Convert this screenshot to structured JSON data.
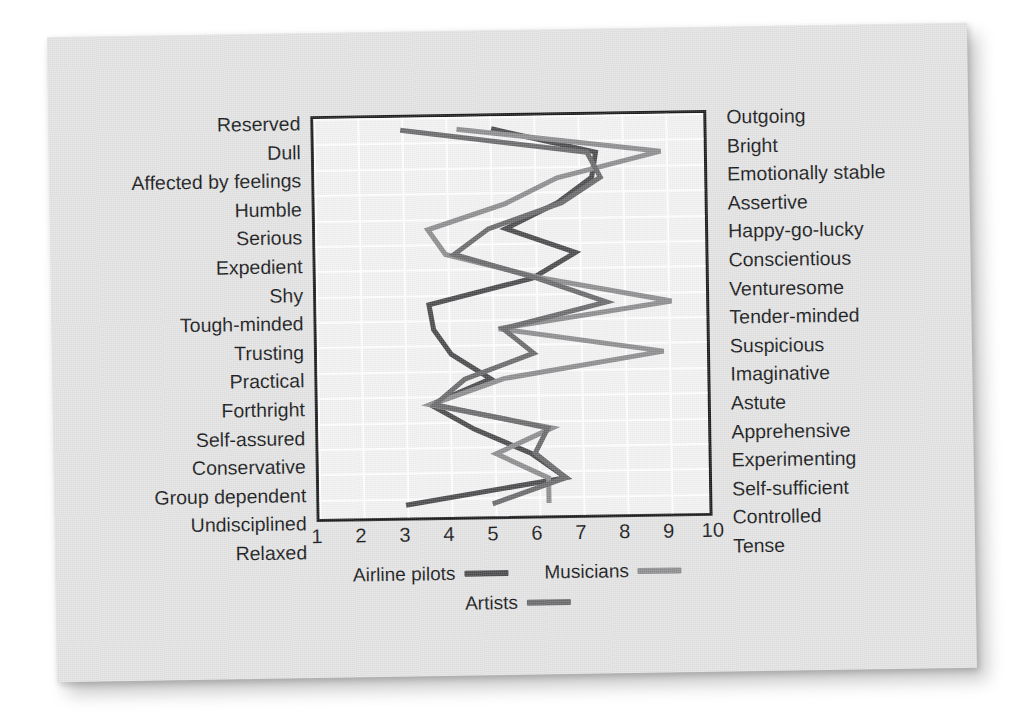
{
  "chart_data": {
    "type": "line",
    "title": "",
    "subtitle": "",
    "orientation": "horizontal-profile",
    "xlabel": "",
    "ylabel": "",
    "xlim": [
      1,
      10
    ],
    "xticks": [
      "1",
      "2",
      "3",
      "4",
      "5",
      "6",
      "7",
      "8",
      "9",
      "10"
    ],
    "grid": true,
    "legend_position": "bottom",
    "categories_left": [
      "Reserved",
      "Dull",
      "Affected by feelings",
      "Humble",
      "Serious",
      "Expedient",
      "Shy",
      "Tough-minded",
      "Trusting",
      "Practical",
      "Forthright",
      "Self-assured",
      "Conservative",
      "Group dependent",
      "Undisciplined",
      "Relaxed"
    ],
    "categories_right": [
      "Outgoing",
      "Bright",
      "Emotionally stable",
      "Assertive",
      "Happy-go-lucky",
      "Conscientious",
      "Venturesome",
      "Tender-minded",
      "Suspicious",
      "Imaginative",
      "Astute",
      "Apprehensive",
      "Experimenting",
      "Self-sufficient",
      "Controlled",
      "Tense"
    ],
    "series": [
      {
        "name": "Airline pilots",
        "color": "#4a4a4c",
        "values": [
          5.1,
          7.5,
          7.4,
          6.6,
          5.4,
          7.0,
          6.0,
          3.6,
          3.7,
          4.1,
          5.0,
          3.6,
          4.6,
          5.9,
          6.7,
          3.0
        ]
      },
      {
        "name": "Musicians",
        "color": "#8d8d8f",
        "values": [
          4.3,
          9.0,
          6.6,
          5.4,
          3.6,
          4.0,
          6.2,
          9.2,
          5.2,
          9.0,
          5.3,
          3.6,
          6.4,
          5.1,
          6.3,
          6.3
        ]
      },
      {
        "name": "Artists",
        "color": "#6a6a6c",
        "values": [
          3.0,
          7.3,
          7.6,
          6.7,
          5.0,
          4.2,
          6.1,
          7.7,
          5.3,
          6.0,
          4.4,
          3.7,
          6.3,
          6.0,
          6.7,
          5.0
        ]
      }
    ]
  },
  "legend": {
    "items": [
      {
        "label": "Airline pilots",
        "color": "#4a4a4c"
      },
      {
        "label": "Musicians",
        "color": "#8d8d8f"
      },
      {
        "label": "Artists",
        "color": "#6a6a6c"
      }
    ]
  }
}
